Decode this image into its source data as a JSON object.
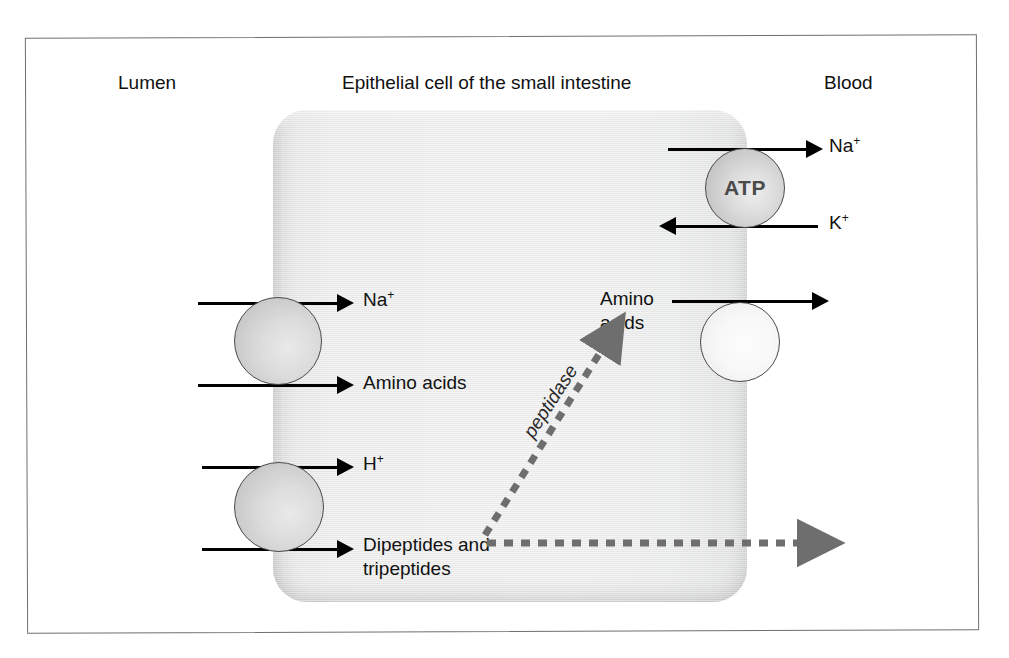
{
  "figure": {
    "title": "Epithelial cell of the small intestine",
    "compartments": {
      "left": "Lumen",
      "right": "Blood"
    }
  },
  "cell": {
    "name": "epithelial-cell"
  },
  "transporters": [
    {
      "id": "na-aa-cotransporter",
      "side": "apical",
      "style": "gray",
      "label": ""
    },
    {
      "id": "h-peptide-cotransporter",
      "side": "apical",
      "style": "gray",
      "label": ""
    },
    {
      "id": "na-k-atpase",
      "side": "basolateral",
      "style": "atp",
      "label": "ATP"
    },
    {
      "id": "aa-facilitated-transporter",
      "side": "basolateral",
      "style": "pale",
      "label": ""
    }
  ],
  "labels": {
    "na_right": "Na",
    "na_right_charge": "+",
    "k_right": "K",
    "k_right_charge": "+",
    "na_left": "Na",
    "na_left_charge": "+",
    "amino_acids_left": "Amino acids",
    "h_left": "H",
    "h_left_charge": "+",
    "dipeptides": "Dipeptides and tripeptides",
    "amino_acids_mid": "Amino acids",
    "atp": "ATP",
    "peptidase": "peptidase"
  },
  "arrows": [
    {
      "id": "na-efflux-to-blood",
      "direction": "right",
      "style": "solid",
      "color": "#000000",
      "label": "Na+"
    },
    {
      "id": "k-influx-from-blood",
      "direction": "left",
      "style": "solid",
      "color": "#000000",
      "label": "K+"
    },
    {
      "id": "na-influx-from-lumen",
      "direction": "right",
      "style": "solid",
      "color": "#000000",
      "label": "Na+"
    },
    {
      "id": "amino-acids-influx-from-lumen",
      "direction": "right",
      "style": "solid",
      "color": "#000000",
      "label": "Amino acids"
    },
    {
      "id": "h-influx-from-lumen",
      "direction": "right",
      "style": "solid",
      "color": "#000000",
      "label": "H+"
    },
    {
      "id": "peptides-influx-from-lumen",
      "direction": "right",
      "style": "solid",
      "color": "#000000",
      "label": "Dipeptides and tripeptides"
    },
    {
      "id": "amino-acids-efflux-to-blood",
      "direction": "right",
      "style": "solid",
      "color": "#000000",
      "label": "Amino acids"
    },
    {
      "id": "peptidase-conversion",
      "direction": "up-right",
      "style": "dashed",
      "color": "#6e6e6e",
      "label": "peptidase"
    },
    {
      "id": "intact-peptides-to-blood",
      "direction": "right",
      "style": "dashed",
      "color": "#6e6e6e",
      "label": ""
    }
  ],
  "colors": {
    "frame": "#6f6f6f",
    "cell_fill": "#eeeeee",
    "arrow_solid": "#000000",
    "arrow_dashed": "#6e6e6e",
    "atp_text": "#4a4a4a"
  }
}
